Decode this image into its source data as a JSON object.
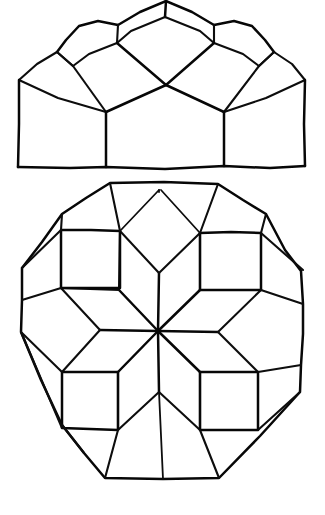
{
  "document": {
    "title": "Hand-drawn geometric dome diagram",
    "background_color": "#ffffff",
    "ink_color": "#0d0d0d",
    "width": 325,
    "height": 515,
    "medium": "pen-on-paper line drawing",
    "figure_count": 2
  },
  "figures": {
    "elevation": {
      "name": "dome-elevation",
      "description": "Side elevation of a segmented dome / vault built from rhombic panels, apex cropped at top edge",
      "bounds": {
        "x": 16,
        "y": 0,
        "width": 292,
        "height": 170
      },
      "baseline_y": 167,
      "apex": {
        "x": 166,
        "y": 1
      },
      "panel_rows": 3,
      "vertical_mullions_x": [
        106,
        224
      ],
      "left_eave": {
        "x": 19,
        "y": 80
      },
      "right_eave": {
        "x": 305,
        "y": 80
      }
    },
    "plan": {
      "name": "dome-plan-rosette",
      "description": "Plan view: regular octagon filled with an eightfold rhombic rosette of 8 rhombi, 8 squares and 8 outer rhombi",
      "bounds": {
        "x": 20,
        "y": 182,
        "width": 285,
        "height": 298
      },
      "center": {
        "x": 158,
        "y": 331
      },
      "octagon_vertices": [
        {
          "x": 110,
          "y": 183
        },
        {
          "x": 218,
          "y": 184
        },
        {
          "x": 266,
          "y": 214
        },
        {
          "x": 301,
          "y": 271
        },
        {
          "x": 303,
          "y": 334
        },
        {
          "x": 300,
          "y": 392
        },
        {
          "x": 219,
          "y": 478
        },
        {
          "x": 105,
          "y": 478
        },
        {
          "x": 62,
          "y": 425
        },
        {
          "x": 21,
          "y": 332
        },
        {
          "x": 22,
          "y": 268
        },
        {
          "x": 62,
          "y": 214
        }
      ],
      "spokes": 8,
      "squares": 4,
      "square_regions": [
        {
          "label": "upper-left",
          "x": 61,
          "y": 230,
          "w": 59,
          "h": 58
        },
        {
          "label": "upper-right",
          "x": 200,
          "y": 233,
          "w": 61,
          "h": 57
        },
        {
          "label": "lower-left",
          "x": 62,
          "y": 372,
          "w": 56,
          "h": 56
        },
        {
          "label": "lower-right",
          "x": 200,
          "y": 372,
          "w": 58,
          "h": 58
        }
      ]
    }
  },
  "labels": {
    "elevation_caption": "",
    "plan_caption": ""
  }
}
